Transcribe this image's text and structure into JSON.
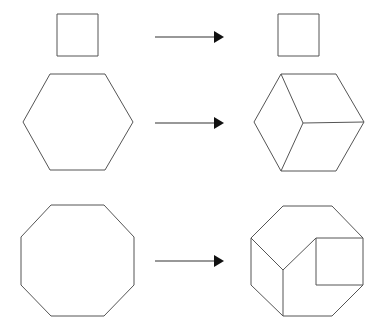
{
  "figure": {
    "background_color": "#ffffff",
    "stroke_color": "#555555",
    "arrow_color": "#111111",
    "width": 383,
    "height": 336,
    "rows": [
      {
        "id": "row-square",
        "label": "square",
        "source": {
          "name": "square-outline",
          "type": "square",
          "sides": 4,
          "points": "57,14 98,14 98,56 57,56"
        },
        "arrow": {
          "name": "arrow-square",
          "shaft": {
            "x1": 155,
            "y1": 37,
            "x2": 215,
            "y2": 37
          },
          "head": "214,31 224,37 214,43"
        },
        "result": {
          "name": "square-dissected-outline",
          "type": "square",
          "pieces": 1,
          "points": "278,14 319,14 319,56 278,56",
          "cuts": []
        }
      },
      {
        "id": "row-hexagon",
        "label": "hexagon",
        "source": {
          "name": "hexagon-outline",
          "type": "hexagon",
          "sides": 6,
          "points": "50,74 105,74 133,122 105,170 50,170 23,122"
        },
        "arrow": {
          "name": "arrow-hexagon",
          "shaft": {
            "x1": 155,
            "y1": 123,
            "x2": 215,
            "y2": 123
          },
          "head": "214,117 224,123 214,129"
        },
        "result": {
          "name": "hexagon-dissected-outline",
          "type": "hexagon",
          "pieces": 3,
          "points": "281,74 336,74 364,122 336,171 281,171 254,122",
          "cuts": [
            "281,74 303,123",
            "281,171 303,123",
            "303,123 364,122"
          ]
        }
      },
      {
        "id": "row-octagon",
        "label": "octagon",
        "source": {
          "name": "octagon-outline",
          "type": "octagon",
          "sides": 8,
          "points": "51,205 104,205 134,237 134,285 104,316 51,316 21,285 21,237"
        },
        "arrow": {
          "name": "arrow-octagon",
          "shaft": {
            "x1": 155,
            "y1": 261,
            "x2": 215,
            "y2": 261
          },
          "head": "214,255 224,261 214,267"
        },
        "result": {
          "name": "octagon-dissected-outline",
          "type": "octagon",
          "pieces": 6,
          "points": "283,206 332,206 363,238 363,285 332,316 283,316 251,285 251,238",
          "cuts": [
            "251,238 283,270",
            "283,270 316,238",
            "283,270 283,316",
            "316,238 363,238",
            "316,238 316,285",
            "316,285 363,285"
          ]
        }
      }
    ]
  }
}
